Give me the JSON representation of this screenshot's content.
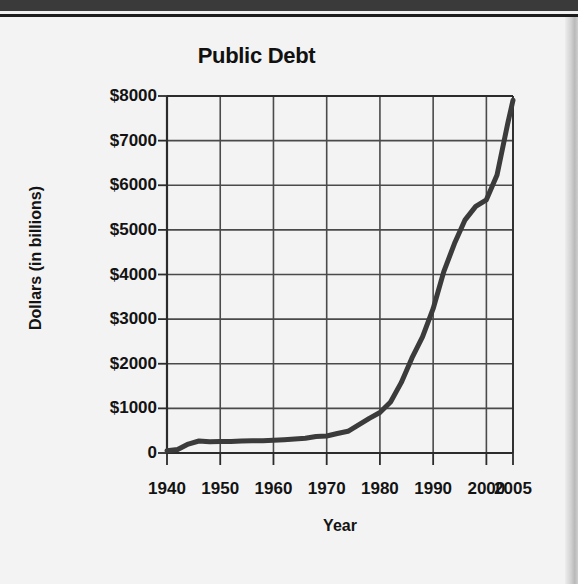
{
  "figure": {
    "title": "Public Debt",
    "x_axis_title": "Year",
    "y_axis_title": "Dollars (in billions)"
  },
  "colors": {
    "line": "#3b3b3b",
    "grid": "#4a4a4a",
    "axis": "#2b2b2b",
    "background": "#f3f3f3",
    "text": "#131313"
  },
  "chart_data": {
    "type": "line",
    "title": "Public Debt",
    "xlabel": "Year",
    "ylabel": "Dollars (in billions)",
    "xlim": [
      1940,
      2005
    ],
    "ylim": [
      0,
      8000
    ],
    "grid": true,
    "legend": false,
    "y_ticks": [
      0,
      1000,
      2000,
      3000,
      4000,
      5000,
      6000,
      7000,
      8000
    ],
    "y_tick_labels": [
      "0",
      "$1000",
      "$2000",
      "$3000",
      "$4000",
      "$5000",
      "$6000",
      "$7000",
      "$8000"
    ],
    "x_ticks": [
      1940,
      1950,
      1960,
      1970,
      1980,
      1990,
      2000,
      2005
    ],
    "x_tick_labels": [
      "1940",
      "1950",
      "1960",
      "1970",
      "1980",
      "1990",
      "2000",
      "2005"
    ],
    "series": [
      {
        "name": "Public Debt",
        "x": [
          1940,
          1942,
          1944,
          1946,
          1948,
          1950,
          1952,
          1954,
          1956,
          1958,
          1960,
          1962,
          1964,
          1966,
          1968,
          1970,
          1972,
          1974,
          1976,
          1978,
          1980,
          1982,
          1984,
          1986,
          1988,
          1990,
          1992,
          1994,
          1996,
          1998,
          2000,
          2002,
          2004,
          2005
        ],
        "y": [
          51,
          79,
          201,
          269,
          252,
          257,
          259,
          271,
          273,
          276,
          286,
          298,
          312,
          329,
          369,
          381,
          437,
          486,
          629,
          777,
          908,
          1142,
          1577,
          2125,
          2602,
          3233,
          4065,
          4693,
          5225,
          5526,
          5674,
          6228,
          7379,
          7905
        ]
      }
    ]
  }
}
